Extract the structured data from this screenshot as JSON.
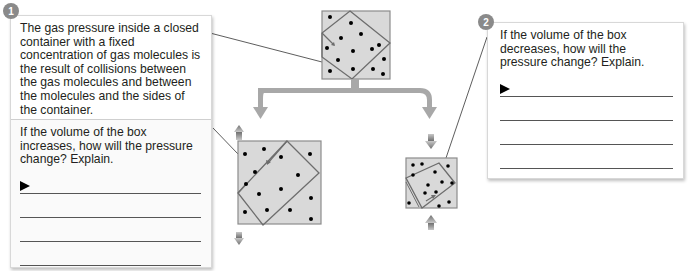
{
  "panel1": {
    "badge": "1",
    "intro": "The gas pressure inside a closed container with a fixed concentration of gas molecules is the result of collisions between the gas molecules and between the molecules and the sides of the container.",
    "question": "If the volume of the box increases, how will the pressure change? Explain.",
    "answer_lines": 4
  },
  "panel2": {
    "badge": "2",
    "question": "If the volume of the box decreases, how will the pressure change? Explain.",
    "answer_lines": 4
  },
  "diagram": {
    "colors": {
      "box_fill": "#d9d9d9",
      "box_border": "#8c8c8c",
      "inner_outline": "#6d6d6d",
      "arrow": "#a8a8a8",
      "small_arrow": "#7a7a7a",
      "molecule": "#000000"
    },
    "boxes": [
      "original-container",
      "expanded-container",
      "compressed-container"
    ]
  }
}
